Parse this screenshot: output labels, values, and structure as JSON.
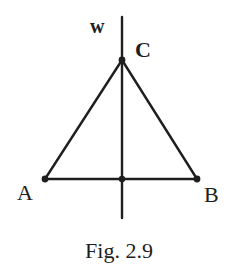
{
  "figure": {
    "caption": "Fig. 2.9",
    "stroke_color": "#1e1e1e",
    "background_color": "#ffffff",
    "labels": {
      "w": "w",
      "c": "C",
      "a": "A",
      "b": "B"
    },
    "points": {
      "A": {
        "x": 45,
        "y": 179
      },
      "B": {
        "x": 197,
        "y": 179
      },
      "C": {
        "x": 122,
        "y": 60
      },
      "M": {
        "x": 122,
        "y": 179
      }
    },
    "line_w": {
      "x": 122,
      "y_top": 17,
      "y_bottom": 218
    }
  }
}
